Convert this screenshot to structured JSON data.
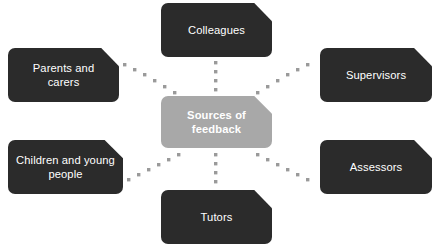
{
  "diagram": {
    "title": "Sources of feedback",
    "type": "hub-and-spoke",
    "colors": {
      "node_fill": "#2b2b2b",
      "center_fill": "#a8a8a8",
      "node_text": "#ffffff",
      "connector_dot": "#9a9a9a",
      "background": "#ffffff"
    },
    "center": {
      "id": "center",
      "label": "Sources of\nfeedback"
    },
    "nodes": [
      {
        "id": "colleagues",
        "label": "Colleagues"
      },
      {
        "id": "parents",
        "label": "Parents and\ncarers"
      },
      {
        "id": "supervisors",
        "label": "Supervisors"
      },
      {
        "id": "children",
        "label": "Children and young\npeople"
      },
      {
        "id": "assessors",
        "label": "Assessors"
      },
      {
        "id": "tutors",
        "label": "Tutors"
      }
    ],
    "connectors": [
      {
        "from": "center",
        "to": "colleagues",
        "style": "dotted",
        "dots": 4
      },
      {
        "from": "center",
        "to": "tutors",
        "style": "dotted",
        "dots": 4
      },
      {
        "from": "center",
        "to": "parents",
        "style": "dotted",
        "dots": 6
      },
      {
        "from": "center",
        "to": "supervisors",
        "style": "dotted",
        "dots": 6
      },
      {
        "from": "center",
        "to": "children",
        "style": "dotted",
        "dots": 6
      },
      {
        "from": "center",
        "to": "assessors",
        "style": "dotted",
        "dots": 6
      }
    ]
  }
}
